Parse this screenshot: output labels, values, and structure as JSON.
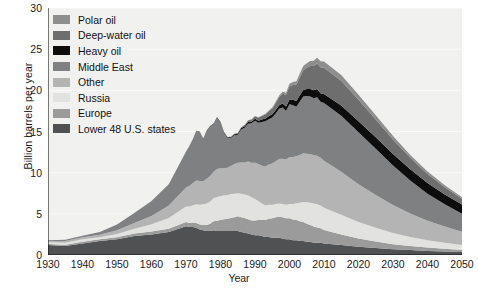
{
  "chart_data": {
    "type": "area",
    "stacked": true,
    "title": "",
    "xlabel": "Year",
    "ylabel": "Billion barrels per year",
    "xlim": [
      1930,
      2050
    ],
    "ylim": [
      0,
      30
    ],
    "xticks": [
      1930,
      1940,
      1950,
      1960,
      1970,
      1980,
      1990,
      2000,
      2010,
      2020,
      2030,
      2040,
      2050
    ],
    "yticks": [
      0,
      5,
      10,
      15,
      20,
      25,
      30
    ],
    "grid": "horizontal-light",
    "legend_position": "top-left",
    "background": "#f1f1ef",
    "x": [
      1930,
      1935,
      1940,
      1945,
      1950,
      1955,
      1960,
      1965,
      1970,
      1971,
      1972,
      1973,
      1974,
      1975,
      1976,
      1977,
      1978,
      1979,
      1980,
      1981,
      1982,
      1983,
      1984,
      1985,
      1986,
      1987,
      1988,
      1989,
      1990,
      1991,
      1992,
      1993,
      1994,
      1995,
      1996,
      1997,
      1998,
      1999,
      2000,
      2001,
      2002,
      2003,
      2004,
      2005,
      2006,
      2007,
      2008,
      2009,
      2010,
      2015,
      2020,
      2025,
      2030,
      2035,
      2040,
      2045,
      2050
    ],
    "series": [
      {
        "name": "Lower 48 U.S. states",
        "color": "#4f5153",
        "values": [
          1.2,
          1.1,
          1.4,
          1.7,
          1.9,
          2.3,
          2.5,
          2.8,
          3.5,
          3.4,
          3.4,
          3.3,
          3.1,
          3.0,
          2.9,
          2.9,
          3.0,
          2.9,
          2.9,
          2.9,
          2.9,
          2.9,
          2.9,
          2.9,
          2.8,
          2.7,
          2.6,
          2.5,
          2.4,
          2.4,
          2.3,
          2.2,
          2.2,
          2.1,
          2.1,
          2.1,
          2.0,
          1.9,
          1.9,
          1.8,
          1.8,
          1.7,
          1.7,
          1.6,
          1.6,
          1.5,
          1.5,
          1.5,
          1.4,
          1.2,
          1.0,
          0.85,
          0.7,
          0.6,
          0.5,
          0.42,
          0.35
        ]
      },
      {
        "name": "Europe",
        "color": "#9b9b9b",
        "values": [
          0.15,
          0.15,
          0.2,
          0.2,
          0.25,
          0.3,
          0.35,
          0.4,
          0.5,
          0.5,
          0.55,
          0.6,
          0.6,
          0.65,
          0.75,
          0.9,
          1.1,
          1.25,
          1.35,
          1.45,
          1.5,
          1.6,
          1.7,
          1.8,
          1.8,
          1.8,
          1.75,
          1.7,
          1.8,
          1.85,
          1.95,
          2.05,
          2.2,
          2.35,
          2.5,
          2.55,
          2.6,
          2.55,
          2.55,
          2.5,
          2.45,
          2.4,
          2.3,
          2.2,
          2.05,
          1.95,
          1.85,
          1.75,
          1.65,
          1.3,
          1.0,
          0.8,
          0.62,
          0.5,
          0.4,
          0.33,
          0.27
        ]
      },
      {
        "name": "Russia",
        "color": "#e2e2e0",
        "values": [
          0.2,
          0.25,
          0.3,
          0.25,
          0.4,
          0.6,
          0.9,
          1.3,
          1.9,
          2.0,
          2.1,
          2.25,
          2.4,
          2.5,
          2.6,
          2.7,
          2.8,
          2.9,
          2.9,
          2.9,
          2.9,
          2.9,
          2.85,
          2.8,
          2.85,
          2.85,
          2.9,
          2.8,
          2.6,
          2.3,
          2.0,
          1.8,
          1.7,
          1.65,
          1.6,
          1.6,
          1.6,
          1.65,
          1.75,
          1.9,
          2.05,
          2.25,
          2.45,
          2.6,
          2.7,
          2.8,
          2.8,
          2.75,
          2.7,
          2.4,
          2.0,
          1.65,
          1.35,
          1.1,
          0.9,
          0.75,
          0.6
        ]
      },
      {
        "name": "Other",
        "color": "#b4b4b4",
        "values": [
          0.15,
          0.2,
          0.25,
          0.3,
          0.45,
          0.7,
          1.0,
          1.5,
          2.3,
          2.5,
          2.7,
          2.9,
          2.9,
          2.8,
          3.0,
          3.1,
          3.2,
          3.4,
          3.4,
          3.3,
          3.3,
          3.4,
          3.6,
          3.7,
          3.8,
          3.9,
          4.1,
          4.2,
          4.4,
          4.5,
          4.6,
          4.7,
          4.9,
          5.0,
          5.2,
          5.4,
          5.5,
          5.5,
          5.7,
          5.7,
          5.7,
          5.8,
          5.9,
          5.9,
          5.9,
          5.9,
          5.9,
          5.8,
          5.7,
          5.2,
          4.6,
          4.0,
          3.4,
          2.85,
          2.35,
          1.95,
          1.6
        ]
      },
      {
        "name": "Middle East",
        "color": "#7f8082",
        "values": [
          0.1,
          0.15,
          0.2,
          0.35,
          0.7,
          1.2,
          1.8,
          2.6,
          4.3,
          4.8,
          5.3,
          6.0,
          5.9,
          5.1,
          5.8,
          6.0,
          5.8,
          6.2,
          5.5,
          4.3,
          3.6,
          3.4,
          3.5,
          3.4,
          4.0,
          4.2,
          4.6,
          4.8,
          5.1,
          5.0,
          5.3,
          5.5,
          5.5,
          5.6,
          5.8,
          6.1,
          6.2,
          5.9,
          6.4,
          6.3,
          6.0,
          6.5,
          6.9,
          7.0,
          7.0,
          6.9,
          7.1,
          6.8,
          7.0,
          6.8,
          6.3,
          5.6,
          4.8,
          4.0,
          3.3,
          2.7,
          2.2
        ]
      },
      {
        "name": "Heavy oil",
        "color": "#0d0d0d",
        "values": [
          0.0,
          0.0,
          0.0,
          0.0,
          0.0,
          0.0,
          0.0,
          0.0,
          0.05,
          0.05,
          0.05,
          0.05,
          0.06,
          0.06,
          0.07,
          0.07,
          0.08,
          0.08,
          0.09,
          0.09,
          0.1,
          0.1,
          0.12,
          0.14,
          0.16,
          0.18,
          0.2,
          0.22,
          0.25,
          0.27,
          0.3,
          0.32,
          0.35,
          0.38,
          0.42,
          0.45,
          0.5,
          0.55,
          0.6,
          0.65,
          0.7,
          0.75,
          0.8,
          0.85,
          0.9,
          0.95,
          1.0,
          1.05,
          1.1,
          1.25,
          1.35,
          1.4,
          1.4,
          1.35,
          1.3,
          1.2,
          1.1
        ]
      },
      {
        "name": "Deep-water oil",
        "color": "#6e6e6e",
        "values": [
          0.0,
          0.0,
          0.0,
          0.0,
          0.0,
          0.0,
          0.0,
          0.0,
          0.0,
          0.0,
          0.0,
          0.0,
          0.0,
          0.0,
          0.0,
          0.0,
          0.0,
          0.0,
          0.02,
          0.03,
          0.04,
          0.05,
          0.07,
          0.09,
          0.12,
          0.15,
          0.2,
          0.25,
          0.3,
          0.35,
          0.42,
          0.5,
          0.6,
          0.7,
          0.85,
          1.0,
          1.2,
          1.4,
          1.6,
          1.8,
          2.0,
          2.2,
          2.4,
          2.6,
          2.8,
          2.95,
          3.1,
          3.15,
          3.2,
          3.0,
          2.6,
          2.15,
          1.75,
          1.4,
          1.1,
          0.88,
          0.7
        ]
      },
      {
        "name": "Polar oil",
        "color": "#8e8e8e",
        "values": [
          0.0,
          0.0,
          0.0,
          0.0,
          0.0,
          0.0,
          0.0,
          0.0,
          0.0,
          0.0,
          0.0,
          0.0,
          0.0,
          0.0,
          0.0,
          0.0,
          0.0,
          0.0,
          0.0,
          0.0,
          0.0,
          0.0,
          0.0,
          0.0,
          0.0,
          0.0,
          0.02,
          0.03,
          0.04,
          0.05,
          0.06,
          0.08,
          0.1,
          0.12,
          0.15,
          0.18,
          0.22,
          0.26,
          0.3,
          0.35,
          0.4,
          0.45,
          0.5,
          0.55,
          0.6,
          0.65,
          0.7,
          0.72,
          0.75,
          0.7,
          0.62,
          0.52,
          0.44,
          0.36,
          0.3,
          0.24,
          0.2
        ]
      }
    ],
    "legend": [
      {
        "label": "Polar oil",
        "color": "#8e8e8e"
      },
      {
        "label": "Deep-water oil",
        "color": "#6e6e6e"
      },
      {
        "label": "Heavy oil",
        "color": "#0d0d0d"
      },
      {
        "label": "Middle East",
        "color": "#7f8082"
      },
      {
        "label": "Other",
        "color": "#b4b4b4"
      },
      {
        "label": "Russia",
        "color": "#e2e2e0"
      },
      {
        "label": "Europe",
        "color": "#9b9b9b"
      },
      {
        "label": "Lower 48 U.S. states",
        "color": "#4f5153"
      }
    ]
  }
}
